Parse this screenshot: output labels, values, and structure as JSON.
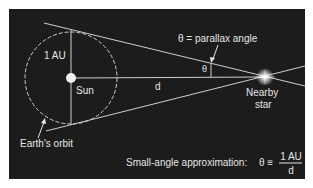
{
  "diagram": {
    "labels": {
      "au": "1 AU",
      "sun": "Sun",
      "distance": "d",
      "theta": "θ",
      "parallax_angle": "θ = parallax angle",
      "star_line1": "Nearby",
      "star_line2": "star",
      "earths_orbit": "Earth's orbit",
      "approx_prefix": "Small-angle approximation:",
      "approx_lhs": "θ ≡",
      "approx_num": "1 AU",
      "approx_den": "d"
    },
    "colors": {
      "background": "#1c1c1c",
      "lines": "#d8d8d8",
      "text": "#e6e6e6",
      "sun": "#f2f2f2",
      "star_glow": "#ffffff"
    },
    "geometry": {
      "sun_center": [
        71,
        78
      ],
      "orbit_radius": 47,
      "star_center": [
        265,
        77
      ]
    }
  }
}
